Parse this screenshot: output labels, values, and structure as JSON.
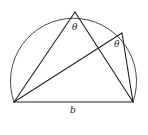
{
  "diagram": {
    "colors": {
      "stroke": "#222222",
      "background": "#ffffff"
    },
    "points": {
      "A": [
        14,
        102
      ],
      "B": [
        133,
        102
      ],
      "P": [
        75,
        12
      ],
      "Q": [
        122,
        33
      ]
    },
    "labels": {
      "angle_top": "θ",
      "angle_right": "θ",
      "chord": "b"
    }
  }
}
